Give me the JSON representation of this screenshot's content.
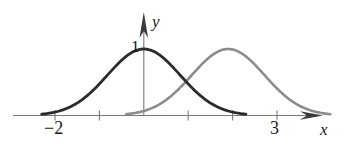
{
  "figure": {
    "title": "",
    "axis_labels": {
      "x": "x",
      "y": "y"
    },
    "tick_labels": {
      "x_neg2": "−2",
      "x_three": "3",
      "y_one": "1"
    },
    "colors": {
      "curve_dark": "#2b2b2b",
      "curve_gray": "#8c8c8c",
      "axis": "#7a7a7a",
      "text": "#1a1a1a",
      "background": "#ffffff"
    }
  },
  "chart_data": {
    "type": "line",
    "title": "",
    "xlabel": "x",
    "ylabel": "y",
    "xlim": [
      -2.95,
      4.05
    ],
    "ylim": [
      -0.12,
      1.45
    ],
    "grid": false,
    "legend": null,
    "x_ticks": [
      -2,
      -1,
      0,
      1,
      2,
      3
    ],
    "x_tick_labels": [
      "−2",
      "",
      "",
      "",
      "",
      "3"
    ],
    "y_ticks": [
      1
    ],
    "y_tick_labels": [
      "1"
    ],
    "series": [
      {
        "name": "dark-bell-curve",
        "color": "#2b2b2b",
        "kind": "gaussian",
        "amplitude": 1.0,
        "mean": 0.0,
        "sigma": 0.82,
        "x_start": -2.3,
        "x_end": 2.3,
        "x": [
          -2.3,
          -2.0,
          -1.75,
          -1.5,
          -1.25,
          -1.0,
          -0.75,
          -0.5,
          -0.25,
          0.0,
          0.25,
          0.5,
          0.75,
          1.0,
          1.25,
          1.5,
          1.75,
          2.0,
          2.3
        ],
        "y": [
          0.02,
          0.05,
          0.09,
          0.19,
          0.32,
          0.48,
          0.66,
          0.83,
          0.96,
          1.0,
          0.96,
          0.83,
          0.66,
          0.48,
          0.32,
          0.19,
          0.09,
          0.05,
          0.02
        ]
      },
      {
        "name": "gray-bell-curve",
        "color": "#8c8c8c",
        "kind": "gaussian",
        "amplitude": 1.0,
        "mean": 1.9,
        "sigma": 0.82,
        "x_start": -0.4,
        "x_end": 4.2,
        "x": [
          -0.4,
          -0.1,
          0.15,
          0.4,
          0.65,
          0.9,
          1.15,
          1.4,
          1.65,
          1.9,
          2.15,
          2.4,
          2.65,
          2.9,
          3.15,
          3.4,
          3.65,
          3.9,
          4.2
        ],
        "y": [
          0.02,
          0.05,
          0.09,
          0.19,
          0.32,
          0.48,
          0.66,
          0.83,
          0.96,
          1.0,
          0.96,
          0.83,
          0.66,
          0.48,
          0.32,
          0.19,
          0.09,
          0.05,
          0.02
        ]
      }
    ],
    "annotations": [
      {
        "name": "curve-intersection",
        "x": 0.95,
        "y": 0.52
      }
    ]
  }
}
